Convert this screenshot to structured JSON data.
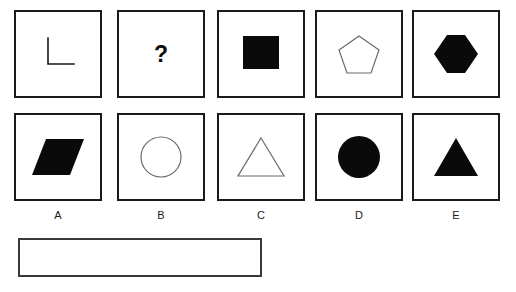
{
  "puzzle": {
    "type": "shape-matrix-multiple-choice",
    "missing_marker": "?",
    "grid": {
      "columns": 5,
      "rows": 2,
      "cells": [
        {
          "id": "r1c1",
          "row": 1,
          "column": 1,
          "shape": "right-angle-line",
          "fill": "none",
          "stroke": "#1a1a1a",
          "description": "L shaped right angle line"
        },
        {
          "id": "r1c2",
          "row": 1,
          "column": 2,
          "shape": "question-mark",
          "fill": "#0d0d0d",
          "stroke": "none",
          "label": "?",
          "description": "bold question mark marking the missing item"
        },
        {
          "id": "r1c3",
          "row": 1,
          "column": 3,
          "shape": "square",
          "fill": "#0a0a0a",
          "stroke": "none",
          "description": "solid black square"
        },
        {
          "id": "r1c4",
          "row": 1,
          "column": 4,
          "shape": "pentagon",
          "fill": "none",
          "stroke": "#6b6b6b",
          "description": "outlined pentagon"
        },
        {
          "id": "r1c5",
          "row": 1,
          "column": 5,
          "shape": "hexagon",
          "fill": "#0a0a0a",
          "stroke": "none",
          "description": "solid black hexagon"
        },
        {
          "id": "r2c1",
          "row": 2,
          "column": 1,
          "shape": "parallelogram",
          "fill": "#0a0a0a",
          "stroke": "none",
          "description": "solid black parallelogram slanted right"
        },
        {
          "id": "r2c2",
          "row": 2,
          "column": 2,
          "shape": "circle",
          "fill": "none",
          "stroke": "#6b6b6b",
          "description": "outlined circle"
        },
        {
          "id": "r2c3",
          "row": 2,
          "column": 3,
          "shape": "triangle",
          "fill": "none",
          "stroke": "#6b6b6b",
          "description": "outlined triangle"
        },
        {
          "id": "r2c4",
          "row": 2,
          "column": 4,
          "shape": "circle",
          "fill": "#0a0a0a",
          "stroke": "none",
          "description": "solid black circle"
        },
        {
          "id": "r2c5",
          "row": 2,
          "column": 5,
          "shape": "triangle",
          "fill": "#0a0a0a",
          "stroke": "none",
          "description": "solid black triangle"
        }
      ]
    },
    "option_labels": [
      {
        "key": "A",
        "label": "A"
      },
      {
        "key": "B",
        "label": "B"
      },
      {
        "key": "C",
        "label": "C"
      },
      {
        "key": "D",
        "label": "D"
      },
      {
        "key": "E",
        "label": "E"
      }
    ],
    "answer_box": {
      "value": "",
      "placeholder": ""
    }
  },
  "colors": {
    "background": "#ffffff",
    "border": "#1a1a1a",
    "fill_black": "#0a0a0a",
    "outline_gray": "#6b6b6b",
    "answer_border": "#3a3a3a",
    "text": "#1a1a1a"
  }
}
